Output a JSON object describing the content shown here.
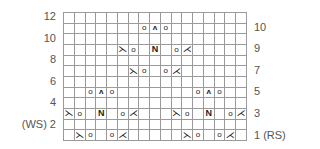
{
  "chart": {
    "columns": 17,
    "rows": 12,
    "grid_color": "#9a9a9a",
    "symbol_color": "#222222",
    "symbol_glyphs": {
      "yo": "o",
      "cdd": "ʌ",
      "N": "N",
      "ssk": "⋋",
      "k2tog": "⋌"
    },
    "symbol_names": {
      "yo": "yarn-over-icon",
      "cdd": "central-double-decrease-icon",
      "N": "no-stitch-icon",
      "ssk": "ssk-decrease-icon",
      "k2tog": "k2tog-decrease-icon"
    },
    "grid": [
      {
        "row": 12,
        "cells": {}
      },
      {
        "row": 11,
        "cells": {
          "7": "yo",
          "8": "cdd",
          "9": "yo"
        }
      },
      {
        "row": 10,
        "cells": {}
      },
      {
        "row": 9,
        "cells": {
          "5": "ssk",
          "6": "yo",
          "8": "N",
          "10": "yo",
          "11": "k2tog"
        }
      },
      {
        "row": 8,
        "cells": {}
      },
      {
        "row": 7,
        "cells": {
          "6": "ssk",
          "7": "yo",
          "9": "yo",
          "10": "k2tog"
        }
      },
      {
        "row": 6,
        "cells": {}
      },
      {
        "row": 5,
        "cells": {
          "2": "yo",
          "3": "cdd",
          "4": "yo",
          "12": "yo",
          "13": "cdd",
          "14": "yo"
        }
      },
      {
        "row": 4,
        "cells": {}
      },
      {
        "row": 3,
        "cells": {
          "0": "ssk",
          "1": "yo",
          "3": "N",
          "5": "yo",
          "6": "k2tog",
          "10": "ssk",
          "11": "yo",
          "13": "N",
          "15": "yo",
          "16": "k2tog"
        }
      },
      {
        "row": 2,
        "cells": {}
      },
      {
        "row": 1,
        "cells": {
          "1": "ssk",
          "2": "yo",
          "4": "yo",
          "5": "k2tog",
          "11": "ssk",
          "12": "yo",
          "14": "yo",
          "15": "k2tog"
        }
      }
    ]
  },
  "labels": {
    "left": [
      {
        "text": "12",
        "y": 17
      },
      {
        "text": "10",
        "y": 39
      },
      {
        "text": "8",
        "y": 60
      },
      {
        "text": "6",
        "y": 82
      },
      {
        "text": "4",
        "y": 103
      },
      {
        "text": "(WS) 2",
        "y": 125
      }
    ],
    "right": [
      {
        "text": "10",
        "y": 28
      },
      {
        "text": "9",
        "y": 49
      },
      {
        "text": "7",
        "y": 71
      },
      {
        "text": "5",
        "y": 92
      },
      {
        "text": "3",
        "y": 114
      },
      {
        "text": "1 (RS)",
        "y": 136
      }
    ]
  }
}
